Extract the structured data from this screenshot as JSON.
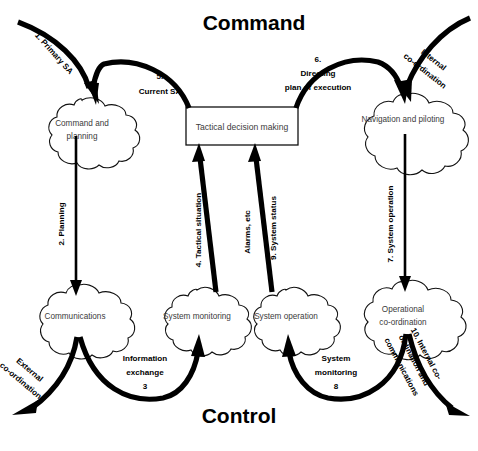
{
  "diagram": {
    "title_top": "Command",
    "title_bottom": "Control",
    "nodes": [
      {
        "id": "command-planning",
        "label_line1": "Command and",
        "label_line2": "planning",
        "shape": "cloud"
      },
      {
        "id": "tactical-decision",
        "label_line1": "Tactical decision making",
        "label_line2": "",
        "shape": "box"
      },
      {
        "id": "navigation-piloting",
        "label_line1": "Navigation and piloting",
        "label_line2": "",
        "shape": "cloud"
      },
      {
        "id": "communications",
        "label_line1": "Communications",
        "label_line2": "",
        "shape": "cloud"
      },
      {
        "id": "system-monitoring",
        "label_line1": "System monitoring",
        "label_line2": "",
        "shape": "cloud"
      },
      {
        "id": "system-operation",
        "label_line1": "System operation",
        "label_line2": "",
        "shape": "cloud"
      },
      {
        "id": "operational-coord",
        "label_line1": "Operational",
        "label_line2": "co-ordination",
        "shape": "cloud"
      }
    ],
    "edges": [
      {
        "id": "primary-sa",
        "lines": [
          "1. Primary SA"
        ]
      },
      {
        "id": "current-sa",
        "lines": [
          "5.",
          "Current SA"
        ]
      },
      {
        "id": "directing-plan",
        "lines": [
          "6.",
          "Directing",
          "plan of execution"
        ]
      },
      {
        "id": "internal-coord-in",
        "lines": [
          "Internal",
          "co-ordination"
        ]
      },
      {
        "id": "planning",
        "lines": [
          "2. Planning"
        ]
      },
      {
        "id": "tactical-situation",
        "lines": [
          "4. Tactical situation"
        ]
      },
      {
        "id": "alarms-etc",
        "lines": [
          "Alarms, etc"
        ]
      },
      {
        "id": "system-status",
        "lines": [
          "9. System status"
        ]
      },
      {
        "id": "system-operation-edge",
        "lines": [
          "7. System operation"
        ]
      },
      {
        "id": "external-coord",
        "lines": [
          "External",
          "co-ordination"
        ]
      },
      {
        "id": "information-exchange",
        "lines": [
          "Information",
          "exchange",
          "3"
        ]
      },
      {
        "id": "system-monitoring-edge",
        "lines": [
          "System",
          "monitoring",
          "8"
        ]
      },
      {
        "id": "internal-coord-out",
        "lines": [
          "10. Internal co-",
          "ordination and",
          "communications"
        ]
      }
    ],
    "colors": {
      "stroke": "#000000",
      "node_text": "#3b3b3b",
      "background": "#ffffff"
    }
  }
}
